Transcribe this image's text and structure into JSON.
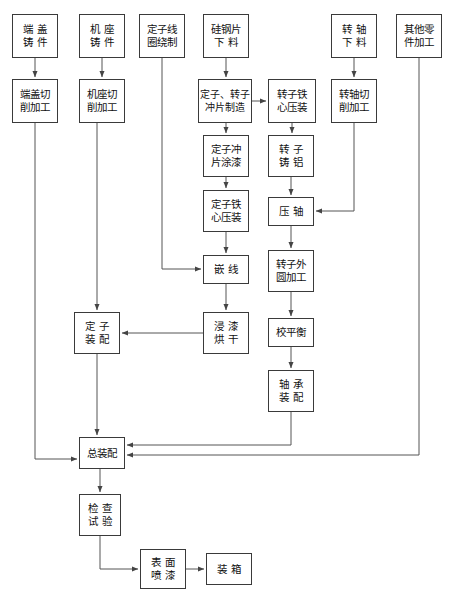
{
  "diagram": {
    "theme": {
      "background": "#ffffff",
      "box_border": "#3a3a3a",
      "line": "#555555",
      "text": "#111111"
    },
    "nodes": [
      {
        "id": "n1",
        "lines": [
          "端 盖",
          "铸 件"
        ],
        "x": 12,
        "y": 14,
        "w": 46,
        "h": 44
      },
      {
        "id": "n2",
        "lines": [
          "机 座",
          "铸 件"
        ],
        "x": 79,
        "y": 14,
        "w": 46,
        "h": 44
      },
      {
        "id": "n3",
        "lines": [
          "定子线",
          "圈绕制"
        ],
        "x": 139,
        "y": 14,
        "w": 46,
        "h": 44
      },
      {
        "id": "n4",
        "lines": [
          "硅钢片",
          "下 料"
        ],
        "x": 203,
        "y": 14,
        "w": 46,
        "h": 44
      },
      {
        "id": "n5",
        "lines": [
          "转 轴",
          "下 料"
        ],
        "x": 331,
        "y": 14,
        "w": 46,
        "h": 44
      },
      {
        "id": "n6",
        "lines": [
          "其他零",
          "件加工"
        ],
        "x": 396,
        "y": 14,
        "w": 46,
        "h": 44
      },
      {
        "id": "n7",
        "lines": [
          "端盖切",
          "削加工"
        ],
        "x": 12,
        "y": 79,
        "w": 46,
        "h": 44
      },
      {
        "id": "n8",
        "lines": [
          "机座切",
          "削加工"
        ],
        "x": 79,
        "y": 79,
        "w": 46,
        "h": 44
      },
      {
        "id": "n9",
        "lines": [
          "定子、转子",
          "冲片制造"
        ],
        "x": 198,
        "y": 79,
        "w": 54,
        "h": 44
      },
      {
        "id": "n10",
        "lines": [
          "转子铁",
          "心压装"
        ],
        "x": 268,
        "y": 79,
        "w": 48,
        "h": 44
      },
      {
        "id": "n11",
        "lines": [
          "转轴切",
          "削加工"
        ],
        "x": 331,
        "y": 79,
        "w": 46,
        "h": 44
      },
      {
        "id": "n12",
        "lines": [
          "定子冲",
          "片涂漆"
        ],
        "x": 203,
        "y": 135,
        "w": 46,
        "h": 42
      },
      {
        "id": "n13",
        "lines": [
          "转 子",
          "铸 铝"
        ],
        "x": 268,
        "y": 135,
        "w": 46,
        "h": 42
      },
      {
        "id": "n14",
        "lines": [
          "定子铁",
          "心压装"
        ],
        "x": 203,
        "y": 190,
        "w": 46,
        "h": 42
      },
      {
        "id": "n15",
        "lines": [
          "压 轴"
        ],
        "x": 268,
        "y": 197,
        "w": 46,
        "h": 29
      },
      {
        "id": "n16",
        "lines": [
          "嵌 线"
        ],
        "x": 203,
        "y": 255,
        "w": 46,
        "h": 29
      },
      {
        "id": "n17",
        "lines": [
          "转子外",
          "圆加工"
        ],
        "x": 268,
        "y": 250,
        "w": 46,
        "h": 42
      },
      {
        "id": "n18",
        "lines": [
          "定 子",
          "装 配"
        ],
        "x": 74,
        "y": 312,
        "w": 46,
        "h": 42
      },
      {
        "id": "n19",
        "lines": [
          "浸 漆",
          "烘 干"
        ],
        "x": 203,
        "y": 312,
        "w": 46,
        "h": 42
      },
      {
        "id": "n20",
        "lines": [
          "校平衡"
        ],
        "x": 268,
        "y": 318,
        "w": 46,
        "h": 29
      },
      {
        "id": "n21",
        "lines": [
          "轴 承",
          "装 配"
        ],
        "x": 268,
        "y": 370,
        "w": 46,
        "h": 42
      },
      {
        "id": "n22",
        "lines": [
          "总装配"
        ],
        "x": 79,
        "y": 437,
        "w": 46,
        "h": 32
      },
      {
        "id": "n23",
        "lines": [
          "检 查",
          "试 验"
        ],
        "x": 79,
        "y": 494,
        "w": 42,
        "h": 42
      },
      {
        "id": "n24",
        "lines": [
          "表 面",
          "喷 漆"
        ],
        "x": 140,
        "y": 549,
        "w": 46,
        "h": 40
      },
      {
        "id": "n25",
        "lines": [
          "装 箱"
        ],
        "x": 206,
        "y": 553,
        "w": 46,
        "h": 32
      }
    ],
    "edges": [
      {
        "from": "n1",
        "to": "n7",
        "kind": "vertical"
      },
      {
        "from": "n2",
        "to": "n8",
        "kind": "vertical"
      },
      {
        "from": "n4",
        "to": "n9",
        "kind": "vertical"
      },
      {
        "from": "n5",
        "to": "n11",
        "kind": "vertical"
      },
      {
        "from": "n9",
        "to": "n10",
        "kind": "horizontal"
      },
      {
        "from": "n9",
        "to": "n12",
        "kind": "vertical"
      },
      {
        "from": "n10",
        "to": "n13",
        "kind": "vertical"
      },
      {
        "from": "n12",
        "to": "n14",
        "kind": "vertical"
      },
      {
        "from": "n13",
        "to": "n15",
        "kind": "vertical"
      },
      {
        "from": "n14",
        "to": "n16",
        "kind": "vertical"
      },
      {
        "from": "n15",
        "to": "n17",
        "kind": "vertical"
      },
      {
        "from": "n16",
        "to": "n19",
        "kind": "vertical"
      },
      {
        "from": "n17",
        "to": "n20",
        "kind": "vertical"
      },
      {
        "from": "n20",
        "to": "n21",
        "kind": "vertical"
      },
      {
        "from": "n19",
        "to": "n18",
        "kind": "elbow-left"
      },
      {
        "from": "n3",
        "to": "n16",
        "kind": "elbow-down-right"
      },
      {
        "from": "n11",
        "to": "n15",
        "kind": "elbow-down-left"
      },
      {
        "from": "n8",
        "to": "n18",
        "kind": "vertical-long"
      },
      {
        "from": "n18",
        "to": "n22",
        "kind": "vertical-long"
      },
      {
        "from": "n7",
        "to": "n22",
        "kind": "elbow-down-right"
      },
      {
        "from": "n21",
        "to": "n22",
        "kind": "elbow-down-left"
      },
      {
        "from": "n6",
        "to": "n22",
        "kind": "elbow-down-left"
      },
      {
        "from": "n22",
        "to": "n23",
        "kind": "vertical"
      },
      {
        "from": "n23",
        "to": "n24",
        "kind": "elbow-down-right"
      },
      {
        "from": "n24",
        "to": "n25",
        "kind": "horizontal"
      }
    ]
  }
}
